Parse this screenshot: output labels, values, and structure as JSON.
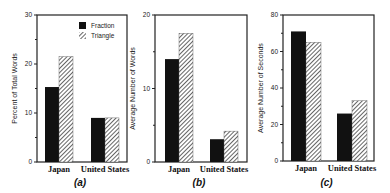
{
  "colors": {
    "fraction": "#111111",
    "triangle_stripe": "#333333",
    "triangle_bg": "#ffffff",
    "axis": "#222222"
  },
  "legend": {
    "items": [
      {
        "label": "Fraction",
        "pattern": "solid"
      },
      {
        "label": "Triangle",
        "pattern": "hatched"
      }
    ]
  },
  "chart_data": [
    {
      "type": "bar",
      "panel": "(a)",
      "title": "",
      "xlabel": "",
      "ylabel": "Percent of Total Words",
      "categories": [
        "Japan",
        "United States"
      ],
      "series": [
        {
          "name": "Fraction",
          "values": [
            15.3,
            9.0
          ]
        },
        {
          "name": "Triangle",
          "values": [
            21.5,
            9.0
          ]
        }
      ],
      "ylim": [
        0,
        30
      ],
      "yticks": [
        0,
        10,
        20,
        30
      ],
      "ytick_labels": [
        "0",
        "10",
        "20",
        "30"
      ],
      "legend_position": "upper right",
      "grid": false
    },
    {
      "type": "bar",
      "panel": "(b)",
      "title": "",
      "xlabel": "",
      "ylabel": "Average Number of Words",
      "categories": [
        "Japan",
        "United States"
      ],
      "series": [
        {
          "name": "Fraction",
          "values": [
            14.0,
            3.1
          ]
        },
        {
          "name": "Triangle",
          "values": [
            17.5,
            4.2
          ]
        }
      ],
      "ylim": [
        0,
        20
      ],
      "yticks": [
        0,
        10,
        20
      ],
      "ytick_labels": [
        "0",
        "10",
        "20"
      ],
      "grid": false
    },
    {
      "type": "bar",
      "panel": "(c)",
      "title": "",
      "xlabel": "",
      "ylabel": "Average Number of Seconds",
      "categories": [
        "Japan",
        "United States"
      ],
      "series": [
        {
          "name": "Fraction",
          "values": [
            71,
            26
          ]
        },
        {
          "name": "Triangle",
          "values": [
            65,
            33
          ]
        }
      ],
      "ylim": [
        0,
        80
      ],
      "yticks": [
        0,
        20,
        40,
        60,
        80
      ],
      "ytick_labels": [
        "0",
        "20",
        "40",
        "60",
        "80"
      ],
      "grid": false
    }
  ],
  "layout": [
    {
      "left": 37,
      "right": 127,
      "top": 15,
      "bottom": 162,
      "groups": [
        45,
        91
      ],
      "barw": 14,
      "minor": true
    },
    {
      "left": 155,
      "right": 247,
      "top": 15,
      "bottom": 162,
      "groups": [
        165,
        210
      ],
      "barw": 14,
      "minor": true
    },
    {
      "left": 283,
      "right": 374,
      "top": 15,
      "bottom": 161,
      "groups": [
        291,
        337
      ],
      "barw": 15,
      "minor": true
    }
  ]
}
